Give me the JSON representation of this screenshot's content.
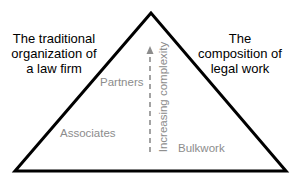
{
  "diagram": {
    "type": "pyramid",
    "left_heading": "The traditional organization of a law firm",
    "right_heading": "The composition of legal work",
    "tiers_left": {
      "top": "Partners",
      "bottom": "Associates"
    },
    "tiers_right": {
      "bottom": "Bulkwork"
    },
    "axis_label": "Increasing complexity",
    "colors": {
      "outline": "#000000",
      "heading_text": "#000000",
      "tier_text": "#8c8c8c",
      "arrow": "#8c8c8c",
      "background": "#ffffff"
    }
  }
}
